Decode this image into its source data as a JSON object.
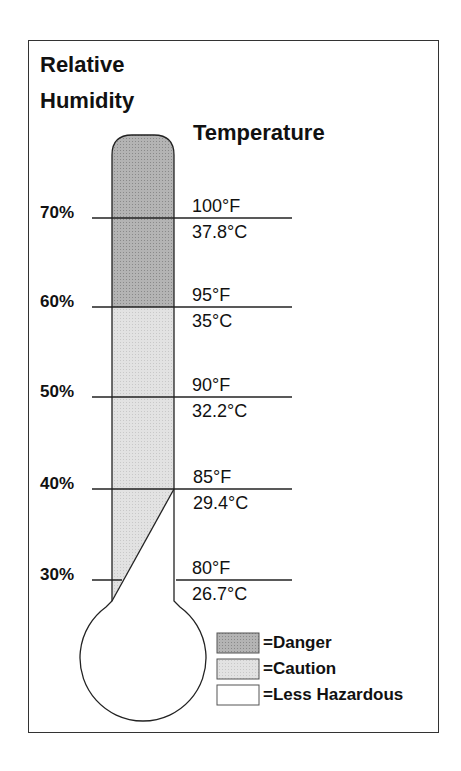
{
  "titles": {
    "humidity_line1": "Relative",
    "humidity_line2": "Humidity",
    "temperature": "Temperature"
  },
  "levels": [
    {
      "humidity": "70%",
      "fahrenheit": "100°F",
      "celsius": "37.8°C"
    },
    {
      "humidity": "60%",
      "fahrenheit": "95°F",
      "celsius": "35°C"
    },
    {
      "humidity": "50%",
      "fahrenheit": "90°F",
      "celsius": "32.2°C"
    },
    {
      "humidity": "40%",
      "fahrenheit": "85°F",
      "celsius": "29.4°C"
    },
    {
      "humidity": "30%",
      "fahrenheit": "80°F",
      "celsius": "26.7°C"
    }
  ],
  "legend": [
    {
      "label": "=Danger",
      "color": "#a9a9a9"
    },
    {
      "label": "=Caution",
      "color": "#dcdcdc"
    },
    {
      "label": "=Less Hazardous",
      "color": "#ffffff"
    }
  ]
}
